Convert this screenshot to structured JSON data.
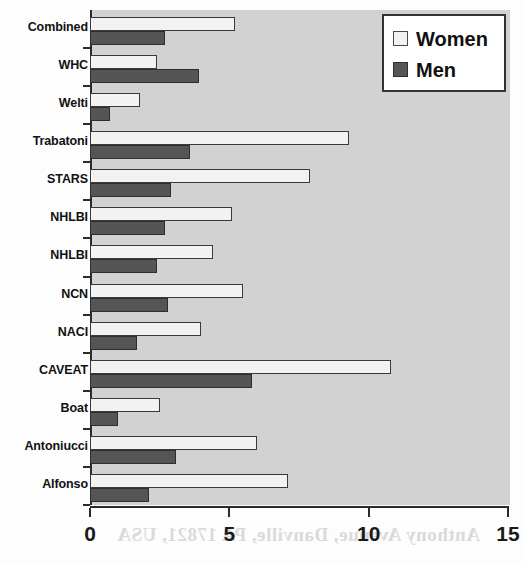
{
  "chart_data": {
    "type": "bar",
    "orientation": "horizontal",
    "title": "",
    "xlabel": "",
    "ylabel": "",
    "xlim": [
      0,
      15
    ],
    "xticks": [
      "0",
      "5",
      "10",
      "15"
    ],
    "xtick_values": [
      0,
      5,
      10,
      15
    ],
    "grid": false,
    "legend_position": "top-right",
    "categories": [
      "Combined",
      "WHC",
      "Welti",
      "Trabatoni",
      "STARS",
      "NHLBI",
      "NHLBI",
      "NCN",
      "NACI",
      "CAVEAT",
      "Boat",
      "Antoniucci",
      "Alfonso"
    ],
    "series": [
      {
        "name": "Women",
        "color": "#f2f2f2",
        "values": [
          5.2,
          2.4,
          1.8,
          9.3,
          7.9,
          5.1,
          4.4,
          5.5,
          4.0,
          10.8,
          2.5,
          6.0,
          7.1
        ]
      },
      {
        "name": "Men",
        "color": "#555555",
        "values": [
          2.7,
          3.9,
          0.7,
          3.6,
          2.9,
          2.7,
          2.4,
          2.8,
          1.7,
          5.8,
          1.0,
          3.1,
          2.1
        ]
      }
    ]
  },
  "legend": {
    "items": [
      {
        "label": "Women",
        "swatch": "women"
      },
      {
        "label": "Men",
        "swatch": "men"
      }
    ]
  },
  "background": {
    "plot_fill": "#d2d2d2",
    "page_fill": "#fdfdfd",
    "axis_color": "#2b2b2b"
  },
  "artifacts": {
    "bleed_through_text": "Anthony Avenue, Danville, PA  17821, USA"
  }
}
